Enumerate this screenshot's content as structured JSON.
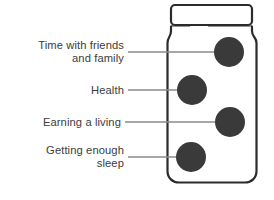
{
  "diagram": {
    "type": "jar-with-labeled-items",
    "title": "",
    "container": {
      "name": "jar",
      "outline_color": "#2b2b2b",
      "fill_color": "#ffffff",
      "stroke_width": 2.2,
      "body": {
        "x": 167,
        "y": 30,
        "width": 90,
        "height": 153,
        "radius": 12
      },
      "lid": {
        "x": 171,
        "y": 5,
        "width": 81,
        "height": 20,
        "radius": 4
      },
      "neck_y": 27
    },
    "items": [
      {
        "label": "Time with friends\nand family",
        "dot": {
          "cx": 229,
          "cy": 52,
          "r": 15,
          "color": "#3a3a3a"
        },
        "leader": {
          "x1": 128,
          "y1": 52,
          "x2": 229,
          "y2": 52,
          "color": "#8a8a8a"
        }
      },
      {
        "label": "Health",
        "dot": {
          "cx": 192,
          "cy": 90,
          "r": 15,
          "color": "#3a3a3a"
        },
        "leader": {
          "x1": 128,
          "y1": 90,
          "x2": 192,
          "y2": 90,
          "color": "#8a8a8a"
        }
      },
      {
        "label": "Earning a living",
        "dot": {
          "cx": 230,
          "cy": 122,
          "r": 15,
          "color": "#3a3a3a"
        },
        "leader": {
          "x1": 125,
          "y1": 122,
          "x2": 230,
          "y2": 122,
          "color": "#8a8a8a"
        }
      },
      {
        "label": "Getting enough\nsleep",
        "dot": {
          "cx": 191,
          "cy": 157,
          "r": 15,
          "color": "#3a3a3a"
        },
        "leader": {
          "x1": 128,
          "y1": 157,
          "x2": 191,
          "y2": 157,
          "color": "#8a8a8a"
        }
      }
    ],
    "colors": {
      "text": "#3c3c3c",
      "outline": "#2b2b2b",
      "dot": "#3a3a3a",
      "leader": "#8a8a8a",
      "background": "#ffffff"
    }
  }
}
